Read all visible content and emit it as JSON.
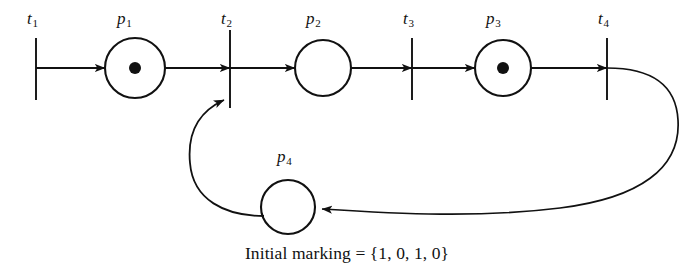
{
  "figure": {
    "kind": "petri-net-diagram",
    "caption": "Initial marking = {1, 0, 1, 0}",
    "stroke_color": "#111111",
    "background_color": "#ffffff"
  },
  "places": [
    {
      "id": "p1",
      "label": "p",
      "subscript": "1",
      "tokens": 1,
      "cx": 135,
      "cy": 68,
      "r": 30,
      "label_x": 117,
      "label_y": 10
    },
    {
      "id": "p2",
      "label": "p",
      "subscript": "2",
      "tokens": 0,
      "cx": 323,
      "cy": 68,
      "r": 28,
      "label_x": 306,
      "label_y": 10
    },
    {
      "id": "p3",
      "label": "p",
      "subscript": "3",
      "tokens": 1,
      "cx": 503,
      "cy": 68,
      "r": 28,
      "label_x": 486,
      "label_y": 10
    },
    {
      "id": "p4",
      "label": "p",
      "subscript": "4",
      "tokens": 0,
      "cx": 288,
      "cy": 207,
      "r": 27,
      "label_x": 277,
      "label_y": 148
    }
  ],
  "transitions": [
    {
      "id": "t1",
      "label": "t",
      "subscript": "1",
      "x": 36,
      "y_top": 38,
      "y_bottom": 100,
      "label_x": 27,
      "label_y": 10
    },
    {
      "id": "t2",
      "label": "t",
      "subscript": "2",
      "x": 230,
      "y_top": 30,
      "y_bottom": 108,
      "label_x": 221,
      "label_y": 10
    },
    {
      "id": "t3",
      "label": "t",
      "subscript": "3",
      "x": 412,
      "y_top": 38,
      "y_bottom": 100,
      "label_x": 403,
      "label_y": 10
    },
    {
      "id": "t4",
      "label": "t",
      "subscript": "4",
      "x": 607,
      "y_top": 38,
      "y_bottom": 100,
      "label_x": 598,
      "label_y": 10
    }
  ],
  "arcs": [
    {
      "id": "arc-t1-p1",
      "from": "t1",
      "to": "p1",
      "shape": "straight"
    },
    {
      "id": "arc-p1-t2",
      "from": "p1",
      "to": "t2",
      "shape": "straight"
    },
    {
      "id": "arc-t2-p2",
      "from": "t2",
      "to": "p2",
      "shape": "straight"
    },
    {
      "id": "arc-p2-t3",
      "from": "p2",
      "to": "t3",
      "shape": "straight"
    },
    {
      "id": "arc-t3-p3",
      "from": "t3",
      "to": "p3",
      "shape": "straight"
    },
    {
      "id": "arc-p3-t4",
      "from": "p3",
      "to": "t4",
      "shape": "straight"
    },
    {
      "id": "arc-t4-p4",
      "from": "t4",
      "to": "p4",
      "shape": "curved"
    },
    {
      "id": "arc-p4-t2",
      "from": "p4",
      "to": "t2",
      "shape": "curved"
    }
  ]
}
